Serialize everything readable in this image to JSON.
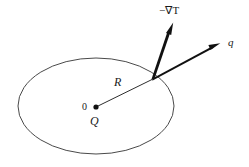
{
  "figure": {
    "title": "",
    "background_color": "#ffffff",
    "stroke_color": "#3a3a3a",
    "arrow_color": "#111111",
    "text_color": "#1a1a1a"
  },
  "labels": {
    "gradient": "−∇T",
    "flux": "q",
    "radius": "R",
    "origin": "0",
    "charge": "Q"
  },
  "shapes": {
    "ellipse": {
      "center_x": 96,
      "center_y": 106,
      "radius_x": 78,
      "radius_y": 48
    },
    "origin_dot": {
      "x": 96,
      "y": 107,
      "radius": 2.6
    },
    "radius_line": {
      "x1": 96,
      "y1": 107,
      "x2": 153,
      "y2": 79
    },
    "gradient_arrow": {
      "x1": 153,
      "y1": 79,
      "x2": 173,
      "y2": 23
    },
    "flux_arrow": {
      "x1": 153,
      "y1": 79,
      "x2": 220,
      "y2": 44
    }
  }
}
